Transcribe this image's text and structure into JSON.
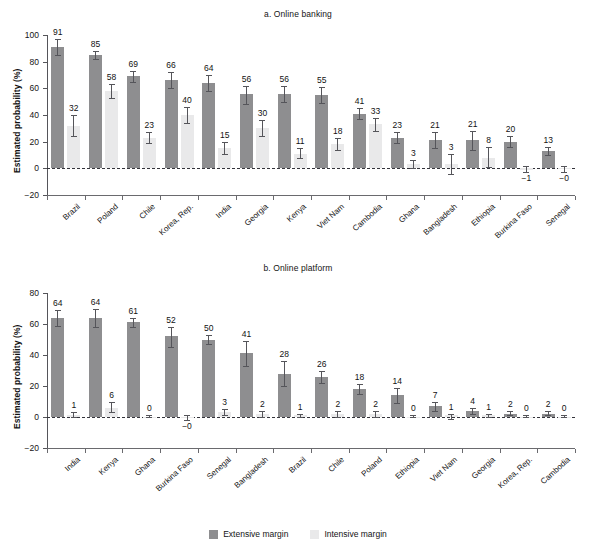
{
  "figure": {
    "legend": {
      "items": [
        {
          "label": "Extensive margin",
          "color": "#8e8e90",
          "key": "extensive"
        },
        {
          "label": "Intensive margin",
          "color": "#e9e9ea",
          "key": "intensive"
        }
      ]
    }
  },
  "chart_data": [
    {
      "type": "bar",
      "panel": "a",
      "title": "a. Online banking",
      "xlabel": "",
      "ylabel": "Estimated probability (%)",
      "ylim": [
        -20,
        100
      ],
      "yticks": [
        -20,
        0,
        20,
        40,
        60,
        80,
        100
      ],
      "ytick_labels": [
        "−20",
        "0",
        "20",
        "40",
        "60",
        "80",
        "100"
      ],
      "grid": false,
      "legend_position": "bottom-center",
      "zero_line": true,
      "categories": [
        "Brazil",
        "Poland",
        "Chile",
        "Korea, Rep.",
        "India",
        "Georgia",
        "Kenya",
        "Viet Nam",
        "Cambodia",
        "Ghana",
        "Bangladesh",
        "Ethiopia",
        "Burkina Faso",
        "Senegal"
      ],
      "series": [
        {
          "name": "Extensive margin",
          "color": "#8e8e90",
          "values": [
            91,
            85,
            69,
            66,
            64,
            56,
            56,
            55,
            41,
            23,
            21,
            21,
            20,
            13
          ],
          "labels": [
            "91",
            "85",
            "69",
            "66",
            "64",
            "56",
            "56",
            "55",
            "41",
            "23",
            "21",
            "21",
            "20",
            "13"
          ],
          "ci_low": [
            85,
            82,
            65,
            60,
            58,
            48,
            50,
            49,
            37,
            19,
            15,
            14,
            16,
            10
          ],
          "ci_high": [
            97,
            88,
            73,
            72,
            70,
            62,
            62,
            61,
            45,
            27,
            27,
            28,
            24,
            16
          ]
        },
        {
          "name": "Intensive margin",
          "color": "#e9e9ea",
          "values": [
            32,
            58,
            23,
            40,
            15,
            30,
            11,
            18,
            33,
            3,
            3,
            8,
            -1,
            -0.4
          ],
          "labels": [
            "32",
            "58",
            "23",
            "40",
            "15",
            "30",
            "11",
            "18",
            "33",
            "3",
            "3",
            "8",
            "−1",
            "−0"
          ],
          "ci_low": [
            24,
            53,
            19,
            34,
            11,
            24,
            8,
            14,
            28,
            0,
            -4,
            1,
            -3,
            -3
          ],
          "ci_high": [
            40,
            63,
            27,
            46,
            20,
            36,
            15,
            23,
            38,
            6,
            11,
            16,
            2,
            2
          ]
        }
      ]
    },
    {
      "type": "bar",
      "panel": "b",
      "title": "b. Online platform",
      "xlabel": "",
      "ylabel": "Estimated probability (%)",
      "ylim": [
        -20,
        80
      ],
      "yticks": [
        -20,
        0,
        20,
        40,
        60,
        80
      ],
      "ytick_labels": [
        "−20",
        "0",
        "20",
        "40",
        "60",
        "80"
      ],
      "grid": false,
      "legend_position": "bottom-center",
      "zero_line": true,
      "categories": [
        "India",
        "Kenya",
        "Ghana",
        "Burkina Faso",
        "Senegal",
        "Bangladesh",
        "Brazil",
        "Chile",
        "Poland",
        "Ethiopia",
        "Viet Nam",
        "Georgia",
        "Korea, Rep.",
        "Cambodia"
      ],
      "series": [
        {
          "name": "Extensive margin",
          "color": "#8e8e90",
          "values": [
            64,
            64,
            61,
            52,
            50,
            41,
            28,
            26,
            18,
            14,
            7,
            4,
            2,
            2
          ],
          "labels": [
            "64",
            "64",
            "61",
            "52",
            "50",
            "41",
            "28",
            "26",
            "18",
            "14",
            "7",
            "4",
            "2",
            "2"
          ],
          "ci_low": [
            59,
            58,
            58,
            45,
            47,
            33,
            20,
            22,
            15,
            9,
            4,
            2,
            1,
            1
          ],
          "ci_high": [
            69,
            70,
            64,
            58,
            53,
            49,
            36,
            30,
            21,
            19,
            10,
            6,
            4,
            4
          ]
        },
        {
          "name": "Intensive margin",
          "color": "#e9e9ea",
          "values": [
            1,
            6,
            0,
            -0.4,
            3,
            2,
            1,
            2,
            2,
            0,
            1,
            1,
            0,
            0
          ],
          "labels": [
            "1",
            "6",
            "0",
            "−0",
            "3",
            "2",
            "1",
            "2",
            "2",
            "0",
            "1",
            "1",
            "0",
            "0"
          ],
          "ci_low": [
            0,
            3,
            0,
            -2,
            1,
            0,
            0,
            0,
            0,
            0,
            -1,
            0,
            0,
            0
          ],
          "ci_high": [
            3,
            10,
            1,
            1,
            5,
            4,
            2,
            4,
            4,
            1,
            2,
            2,
            1,
            1
          ]
        }
      ]
    }
  ]
}
